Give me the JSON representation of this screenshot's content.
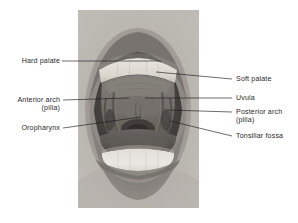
{
  "figure": {
    "kind": "labeled-anatomy-photograph",
    "photo": {
      "palette": {
        "background": "#ffffff",
        "skin_light": "#c9c5c0",
        "skin_mid": "#a8a39d",
        "lip_dark": "#6f6a66",
        "oral_cavity_dark": "#4e4a47",
        "palate_mid": "#7c7772",
        "tooth_white": "#f2f0ea",
        "tongue_mid": "#8b8681"
      }
    }
  },
  "labels": {
    "left": [
      {
        "id": "hard-palate",
        "line1": "Hard palate",
        "line2": ""
      },
      {
        "id": "anterior-arch",
        "line1": "Anterior arch",
        "line2": "(pilla)"
      },
      {
        "id": "oropharynx",
        "line1": "Oropharynx",
        "line2": ""
      }
    ],
    "right": [
      {
        "id": "soft-palate",
        "line1": "Soft palate",
        "line2": ""
      },
      {
        "id": "uvula",
        "line1": "Uvula",
        "line2": ""
      },
      {
        "id": "posterior-arch",
        "line1": "Posterior arch",
        "line2": "(pilla)"
      },
      {
        "id": "tonsillar-fossa",
        "line1": "Tonsillar fossa",
        "line2": ""
      }
    ]
  },
  "leader_lines": {
    "hard_palate": {
      "x1": 62,
      "y1": 61,
      "x2": 161,
      "y2": 61
    },
    "anterior_arch": {
      "x1": 63,
      "y1": 100,
      "x2": 129,
      "y2": 98
    },
    "oropharynx": {
      "x1": 63,
      "y1": 128,
      "x2": 141,
      "y2": 117
    },
    "soft_palate": {
      "x1": 232,
      "y1": 79,
      "x2": 156,
      "y2": 72
    },
    "uvula": {
      "x1": 232,
      "y1": 98,
      "x2": 145,
      "y2": 98
    },
    "posterior_arch": {
      "x1": 232,
      "y1": 112,
      "x2": 168,
      "y2": 110
    },
    "tonsillar_fossa": {
      "x1": 232,
      "y1": 136,
      "x2": 170,
      "y2": 121
    }
  }
}
